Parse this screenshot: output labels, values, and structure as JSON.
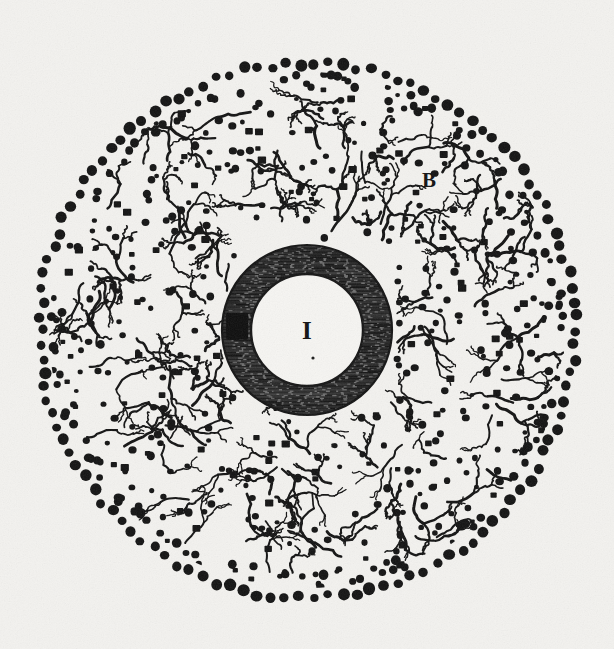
{
  "figure": {
    "domain": "Natural-Image",
    "kind": "historical-engraving",
    "subject": "Circular microscopic section with central nucleus, hatched annulus and stippled outer zone",
    "background_color": "#f3f2ef",
    "ink_color": "#121212",
    "width": 614,
    "height": 649
  },
  "geometry": {
    "center_x": 307,
    "center_y": 330,
    "outer_ring_radius": 268,
    "stipple_field_radius": 258,
    "annulus_outer_radius": 85,
    "annulus_inner_radius": 56,
    "boundary_dot_radius": 5.2,
    "interior_dot_radius_min": 2.4,
    "interior_dot_radius_max": 4.2
  },
  "labels": [
    {
      "id": "label-i",
      "text": "I",
      "x": 307,
      "y": 339,
      "region": "central-white-disc",
      "description": "Serif capital I marking the central clear nucleus"
    },
    {
      "id": "label-b",
      "text": "B",
      "x": 429,
      "y": 187,
      "region": "outer-stippled-zone",
      "description": "Label in the upper-right stippled field"
    }
  ],
  "marks": {
    "dark_blotch": {
      "id": "annulus-dark-mark",
      "description": "Solid ink blotch on the left side of the hatched annulus",
      "angle_degrees": 183,
      "radius": 70,
      "width": 22,
      "height": 27
    },
    "center_speck": {
      "description": "Tiny ink speck below the central I",
      "x": 313,
      "y": 358,
      "radius": 1.6
    }
  },
  "zones": [
    {
      "name": "central-disc",
      "label": "I",
      "fill": "#f6f5f2",
      "description": "Clear white central circle with a fine dark outline"
    },
    {
      "name": "hatched-annulus",
      "label": "II",
      "fill": "#3a3a3a",
      "description": "Dark ring rendered in fine horizontal engraving lines"
    },
    {
      "name": "stippled-field",
      "label": "B",
      "fill": "#f3f2ef",
      "description": "Broad outer field of scattered round dots with branching filaments"
    },
    {
      "name": "boundary-ring",
      "label": "",
      "fill": "#121212",
      "description": "Dense circle of large round dots forming the outer limit"
    }
  ],
  "counts": {
    "boundary_dots": 118,
    "interior_dots": 430,
    "filaments": 150,
    "hatch_lines": 118
  }
}
